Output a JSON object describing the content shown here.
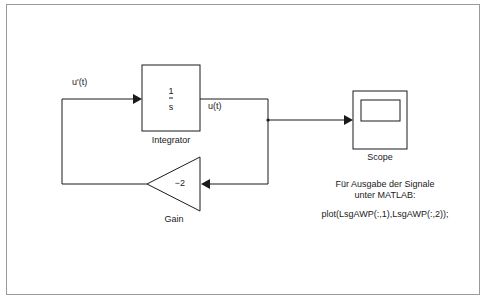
{
  "diagram": {
    "blocks": {
      "integrator": {
        "numerator": "1",
        "denominator": "s",
        "label": "Integrator"
      },
      "gain": {
        "value": "−2",
        "label": "Gain"
      },
      "scope": {
        "label": "Scope"
      }
    },
    "signals": {
      "input": "u'(t)",
      "output": "u(t)"
    },
    "note": {
      "line1": "Für Ausgabe der Signale",
      "line2": "unter MATLAB:",
      "command": "plot(LsgAWP(:,1),LsgAWP(:,2));"
    },
    "colors": {
      "line": "#1a1a1a",
      "frame": "#9a9a9a",
      "background": "#ffffff"
    }
  }
}
